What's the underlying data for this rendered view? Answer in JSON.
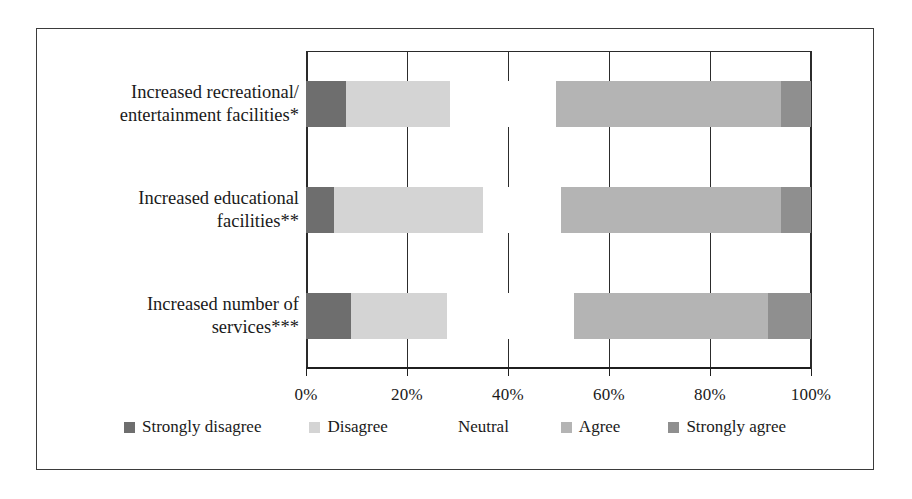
{
  "chart_data": {
    "type": "bar",
    "orientation": "horizontal",
    "stacked": true,
    "normalized": true,
    "title": "",
    "xlabel": "",
    "ylabel": "",
    "xlim": [
      0,
      100
    ],
    "xticks": [
      0,
      20,
      40,
      60,
      80,
      100
    ],
    "xticklabels": [
      "0%",
      "20%",
      "40%",
      "60%",
      "80%",
      "100%"
    ],
    "grid": "vertical",
    "legend_position": "bottom",
    "categories": [
      "Increased recreational/\nentertainment facilities*",
      "Increased educational\nfacilities**",
      "Increased number of\nservices***"
    ],
    "category_lines": [
      [
        "Increased recreational/",
        "entertainment facilities*"
      ],
      [
        "Increased educational",
        "facilities**"
      ],
      [
        "Increased number of",
        "services***"
      ]
    ],
    "series": [
      {
        "name": "Strongly disagree",
        "color": "#6e6e6e",
        "values": [
          8.0,
          5.5,
          9.0
        ]
      },
      {
        "name": "Disagree",
        "color": "#d4d4d4",
        "values": [
          20.5,
          29.5,
          19.0
        ]
      },
      {
        "name": "Neutral",
        "color": "#ffffff",
        "values": [
          21.0,
          15.5,
          25.0
        ]
      },
      {
        "name": "Agree",
        "color": "#b4b4b4",
        "values": [
          44.5,
          43.5,
          38.5
        ]
      },
      {
        "name": "Strongly agree",
        "color": "#8f8f8f",
        "values": [
          6.0,
          6.0,
          8.5
        ]
      }
    ]
  },
  "legend": {
    "items": [
      {
        "label": "Strongly disagree",
        "color": "#6e6e6e"
      },
      {
        "label": "Disagree",
        "color": "#d4d4d4"
      },
      {
        "label": "Neutral",
        "color": "#ffffff"
      },
      {
        "label": "Agree",
        "color": "#b4b4b4"
      },
      {
        "label": "Strongly agree",
        "color": "#8f8f8f"
      }
    ]
  },
  "style": {
    "border_color": "#3b3b3b",
    "axis_color": "#1f1f1f",
    "grid_color": "#2c2c2c",
    "text_color": "#1a1a1a",
    "background": "#ffffff"
  }
}
